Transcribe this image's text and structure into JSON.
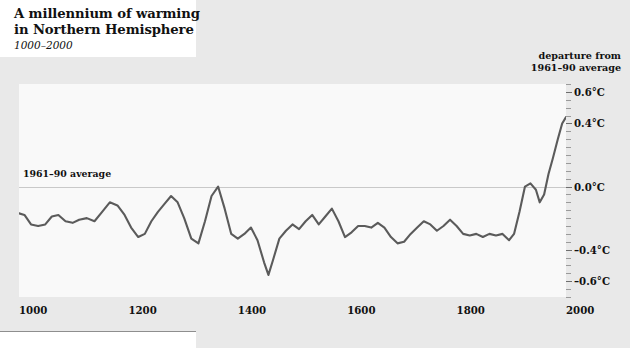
{
  "title": {
    "line1": "A millennium of warming",
    "line2": "in Northern Hemisphere",
    "subtitle": "1000–2000"
  },
  "axis_caption": {
    "line1": "departure from",
    "line2": "1961–90 average"
  },
  "annotations": {
    "baseline_label": "1961–90 average"
  },
  "colors": {
    "page_background": "#e9e9e9",
    "panel_background": "#ffffff",
    "plot_background": "#f9f9f9",
    "series_line": "#5b5b5b",
    "zero_line": "#c9c9c9",
    "text": "#111111"
  },
  "chart_data": {
    "type": "line",
    "title": "A millennium of warming in Northern Hemisphere",
    "subtitle": "1000–2000",
    "xlabel": "",
    "ylabel": "departure from 1961–90 average",
    "xlim": [
      1000,
      2000
    ],
    "ylim": [
      -0.7,
      0.65
    ],
    "xticks": [
      1000,
      1200,
      1400,
      1600,
      1800,
      2000
    ],
    "xticklabels": [
      "1000",
      "1200",
      "1400",
      "1600",
      "1800",
      "2000"
    ],
    "yticks": [
      0.6,
      0.4,
      0.0,
      -0.4,
      -0.6
    ],
    "yticklabels": [
      "0.6°C",
      "0.4°C",
      "0.0°C",
      "–0.4°C",
      "–0.6°C"
    ],
    "grid": false,
    "legend": null,
    "reference_lines": [
      {
        "y": 0.0,
        "label": "1961–90 average"
      }
    ],
    "series": [
      {
        "name": "Northern Hemisphere temperature anomaly",
        "units": "°C",
        "x": [
          1000,
          1010,
          1022,
          1035,
          1048,
          1060,
          1072,
          1085,
          1098,
          1110,
          1124,
          1138,
          1152,
          1166,
          1180,
          1193,
          1205,
          1218,
          1230,
          1242,
          1254,
          1266,
          1278,
          1290,
          1302,
          1315,
          1328,
          1340,
          1352,
          1364,
          1376,
          1388,
          1400,
          1412,
          1424,
          1436,
          1448,
          1456,
          1464,
          1476,
          1488,
          1500,
          1512,
          1524,
          1536,
          1548,
          1560,
          1572,
          1584,
          1596,
          1608,
          1620,
          1632,
          1644,
          1656,
          1668,
          1680,
          1692,
          1704,
          1716,
          1728,
          1740,
          1752,
          1764,
          1776,
          1788,
          1800,
          1812,
          1824,
          1836,
          1848,
          1860,
          1872,
          1884,
          1896,
          1905,
          1915,
          1925,
          1935,
          1945,
          1952,
          1960,
          1968,
          1976,
          1985,
          1993,
          2000
        ],
        "values": [
          -0.17,
          -0.18,
          -0.24,
          -0.25,
          -0.24,
          -0.19,
          -0.18,
          -0.22,
          -0.23,
          -0.21,
          -0.2,
          -0.22,
          -0.16,
          -0.1,
          -0.12,
          -0.18,
          -0.26,
          -0.32,
          -0.3,
          -0.22,
          -0.16,
          -0.11,
          -0.06,
          -0.1,
          -0.2,
          -0.33,
          -0.36,
          -0.22,
          -0.06,
          0.0,
          -0.14,
          -0.3,
          -0.33,
          -0.3,
          -0.26,
          -0.34,
          -0.48,
          -0.56,
          -0.47,
          -0.33,
          -0.28,
          -0.24,
          -0.27,
          -0.22,
          -0.18,
          -0.24,
          -0.19,
          -0.14,
          -0.22,
          -0.32,
          -0.29,
          -0.25,
          -0.25,
          -0.26,
          -0.23,
          -0.26,
          -0.32,
          -0.36,
          -0.35,
          -0.3,
          -0.26,
          -0.22,
          -0.24,
          -0.28,
          -0.25,
          -0.21,
          -0.25,
          -0.3,
          -0.31,
          -0.3,
          -0.32,
          -0.3,
          -0.31,
          -0.3,
          -0.34,
          -0.3,
          -0.16,
          0.0,
          0.02,
          -0.02,
          -0.1,
          -0.05,
          0.08,
          0.18,
          0.3,
          0.4,
          0.44
        ]
      }
    ]
  }
}
